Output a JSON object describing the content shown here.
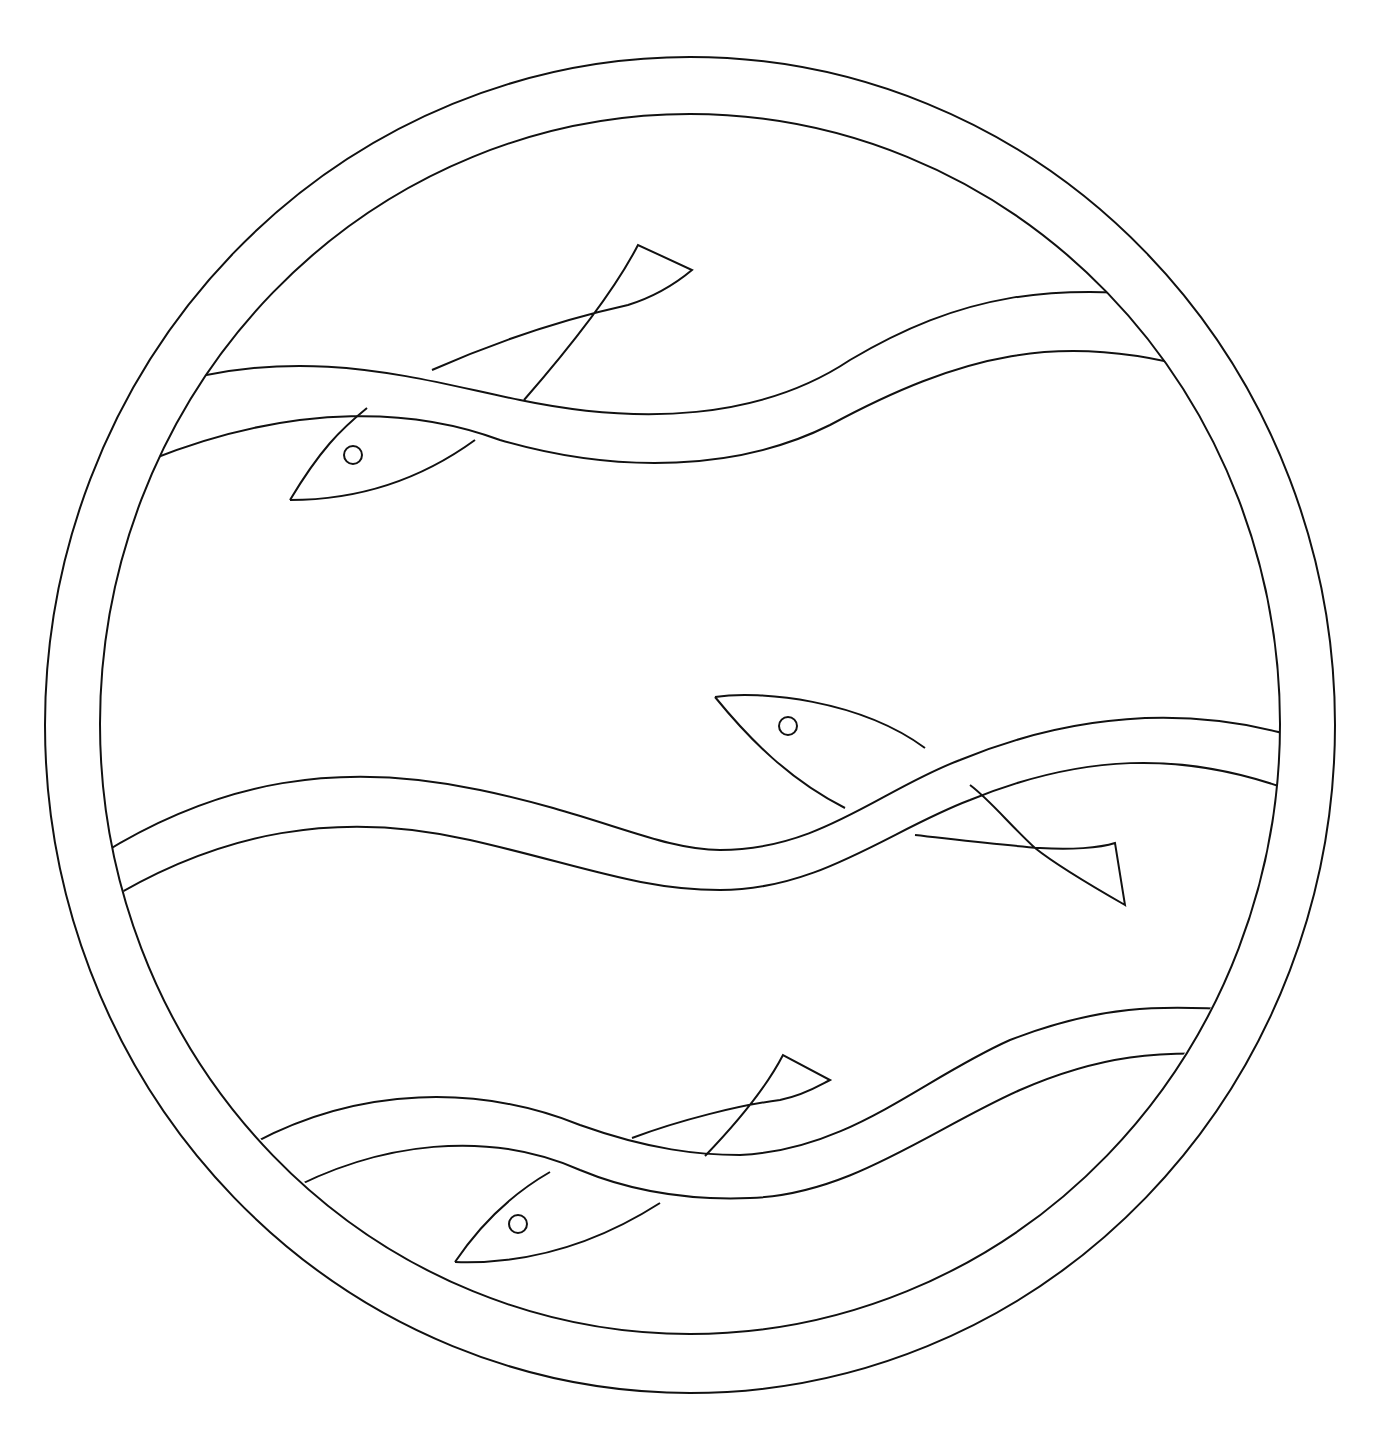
{
  "page": {
    "type": "coloring page",
    "header_text": "",
    "line_color": "#111111",
    "background": "#ffffff"
  },
  "artwork": {
    "frame": "double circular ring",
    "bands": [
      "top wave band",
      "middle wave band",
      "bottom wave band"
    ],
    "fish": [
      {
        "id": "fish-top",
        "direction": "left",
        "weaves": "under top band"
      },
      {
        "id": "fish-middle",
        "direction": "left",
        "weaves": "under middle band"
      },
      {
        "id": "fish-bottom",
        "direction": "left",
        "weaves": "under bottom band"
      }
    ]
  }
}
